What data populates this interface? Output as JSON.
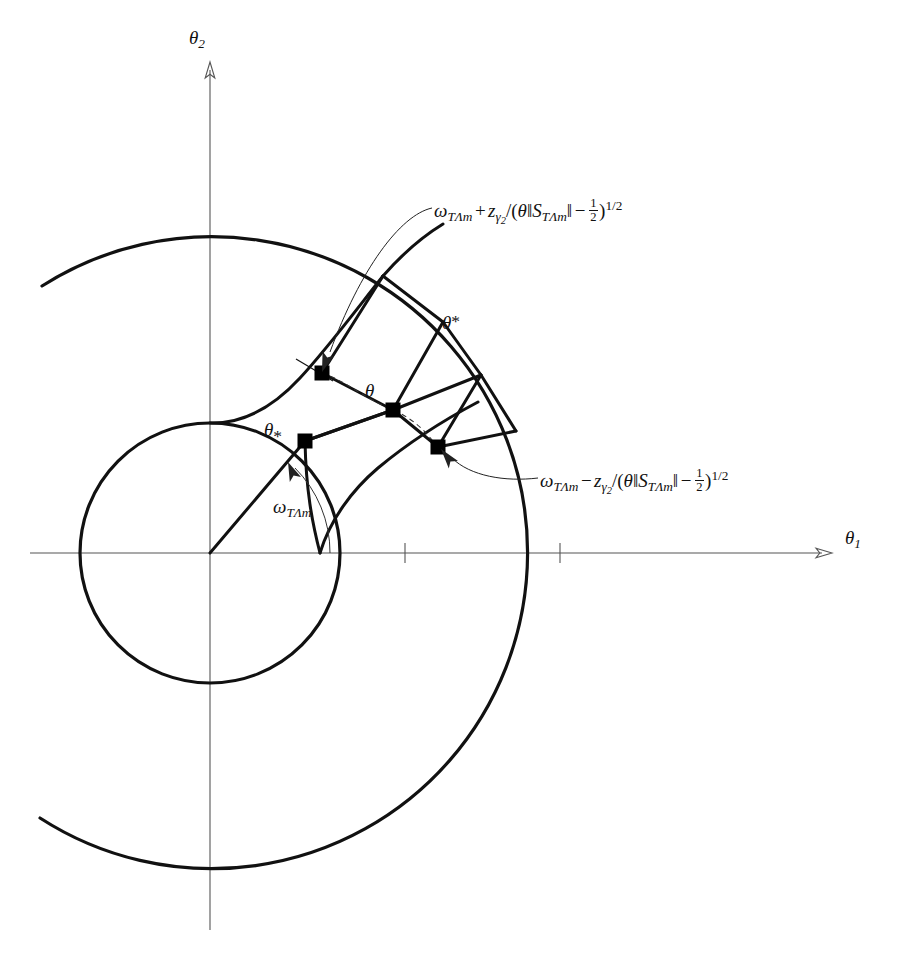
{
  "figure": {
    "kind": "geometric-confidence-region-diagram",
    "background_color": "#ffffff",
    "stroke_color": "#111111",
    "axis_color": "#555555"
  },
  "axes": {
    "x_axis_label": "θ₁",
    "y_axis_label": "θ₂",
    "x_label_parts": {
      "symbol": "θ",
      "subscript": "1"
    },
    "y_label_parts": {
      "symbol": "θ",
      "subscript": "2"
    },
    "origin_px": {
      "x": 210,
      "y": 553
    },
    "x_ticks_px": [
      405,
      560
    ],
    "tick_count": 2
  },
  "labels": {
    "upper_bound": {
      "text": "ω_TΛm + z_γ2/(θ‖S_TΛm‖ − 1/2)^{1/2}",
      "omega": "ω",
      "omega_sub": "TΛm",
      "operator": "+",
      "z": "z",
      "z_sub": "γ",
      "z_sub_sub": "2",
      "slash": "/",
      "open_paren": "(",
      "theta": "θ",
      "norm_open": "‖",
      "S": "S",
      "S_sub": "TΛm",
      "norm_close": "‖",
      "minus": "−",
      "frac_num": "1",
      "frac_den": "2",
      "close_paren": ")",
      "exponent": "1/2"
    },
    "lower_bound": {
      "text": "ω_TΛm − z_γ2/(θ‖S_TΛm‖ − 1/2)^{1/2}",
      "omega": "ω",
      "omega_sub": "TΛm",
      "operator": "−",
      "z": "z",
      "z_sub": "γ",
      "z_sub_sub": "2",
      "slash": "/",
      "open_paren": "(",
      "theta": "θ",
      "norm_open": "‖",
      "S": "S",
      "S_sub": "TΛm",
      "norm_close": "‖",
      "minus": "−",
      "frac_num": "1",
      "frac_den": "2",
      "close_paren": ")",
      "exponent": "1/2"
    },
    "angle_omega": {
      "text": "ω_TΛm",
      "omega": "ω",
      "omega_sub": "TΛm"
    },
    "theta_upper_star": {
      "text": "θ*",
      "symbol": "θ",
      "star": "*"
    },
    "theta_lower_star": {
      "text": "θ*",
      "symbol": "θ",
      "star": "*"
    },
    "theta_center": {
      "text": "θ",
      "symbol": "θ"
    }
  },
  "markers": {
    "description": "filled square points on the confidence band",
    "points": [
      {
        "name": "theta-hat-upper",
        "x": 322,
        "y": 373
      },
      {
        "name": "theta-hat-center",
        "x": 393,
        "y": 410
      },
      {
        "name": "theta-hat-lower",
        "x": 438,
        "y": 447
      },
      {
        "name": "theta-lower-star",
        "x": 305,
        "y": 441
      }
    ]
  },
  "geometry": {
    "inner_circle": {
      "cx": 210,
      "cy": 553,
      "r": 130
    },
    "outer_arc": {
      "cx": 210,
      "cy": 553,
      "r": 316
    },
    "radial_angles_deg": [
      58,
      45,
      33
    ],
    "band_description": "curvilinear band bounded by two radial curves and the inner circle / outer arc"
  }
}
